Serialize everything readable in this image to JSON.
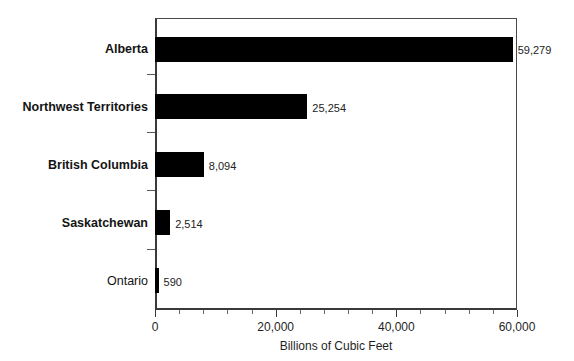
{
  "chart_data": {
    "type": "bar",
    "orientation": "horizontal",
    "title": "",
    "xlabel": "Billions of Cubic Feet",
    "ylabel": "",
    "categories": [
      "Alberta",
      "Northwest Territories",
      "British Columbia",
      "Saskatchewan",
      "Ontario"
    ],
    "values": [
      59279,
      25254,
      8094,
      2514,
      590
    ],
    "value_labels": [
      "59,279",
      "25,254",
      "8,094",
      "2,514",
      "590"
    ],
    "xlim": [
      0,
      60000
    ],
    "xticks": [
      0,
      20000,
      40000,
      60000
    ],
    "xtick_labels": [
      "0",
      "20,000",
      "40,000",
      "60,000"
    ],
    "minor_tick_step": 4000,
    "grid": false,
    "legend": null,
    "bar_color": "#000000",
    "axis_color": "#3a3a3a",
    "label_emphasis": [
      "bold",
      "bold",
      "bold",
      "bold",
      "regular"
    ]
  },
  "axis": {
    "xlabel": "Billions of Cubic Feet",
    "tick_0": "0",
    "tick_20000": "20,000",
    "tick_40000": "40,000",
    "tick_60000": "60,000"
  },
  "categories": {
    "c0": "Alberta",
    "c1": "Northwest Territories",
    "c2": "British Columbia",
    "c3": "Saskatchewan",
    "c4": "Ontario"
  },
  "values": {
    "v0": "59,279",
    "v1": "25,254",
    "v2": "8,094",
    "v3": "2,514",
    "v4": "590"
  }
}
